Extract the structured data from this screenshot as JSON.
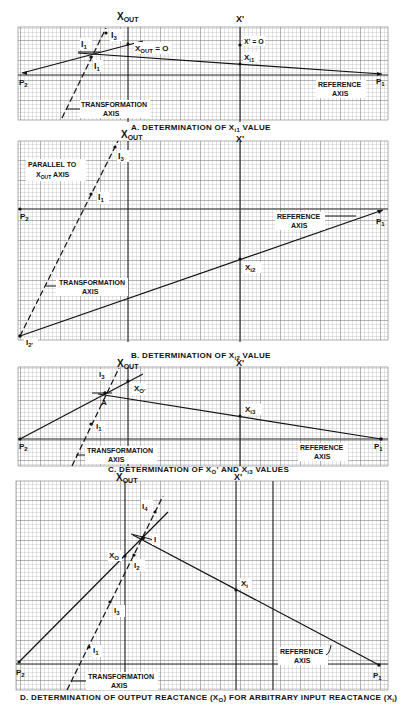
{
  "figure": {
    "colors": {
      "background": "#ffffff",
      "grid_minor": "#9a9a9a",
      "grid_major": "#3a3a3a",
      "ink": "#111111"
    },
    "panels": [
      {
        "id": "A",
        "caption": "A. DETERMINATION OF X",
        "caption_sub": "i1",
        "caption_tail": " VALUE",
        "axis_top_left": "X",
        "axis_top_left_sub": "OUT",
        "axis_top_right": "X'",
        "labels": {
          "i3": "I",
          "i3_sub": "3",
          "i1p": "I",
          "i1p_sub": "1",
          "i1": "I",
          "i1_sub": "1",
          "xout_zero": "X",
          "xout_zero_sub": "OUT",
          "xout_zero_tail": " = O",
          "xprime_zero": "X' = O",
          "xi1": "X",
          "xi1_sub": "i1",
          "p1": "P",
          "p1_sub": "1",
          "p2": "P",
          "p2_sub": "2",
          "ref_axis_1": "REFERENCE",
          "ref_axis_2": "AXIS",
          "trans_axis_1": "TRANSFORMATION",
          "trans_axis_2": "AXIS"
        }
      },
      {
        "id": "B",
        "caption": "B. DETERMINATION OF X",
        "caption_sub": "i2",
        "caption_tail": " VALUE",
        "axis_top_left": "X",
        "axis_top_left_sub": "OUT",
        "axis_top_right": "X'",
        "labels": {
          "i3": "I",
          "i3_sub": "3",
          "i1": "I",
          "i1_sub": "1",
          "i2p": "I",
          "i2p_sub": "2'",
          "parallel_1": "PARALLEL TO",
          "parallel_2": "X",
          "parallel_2_sub": "OUT",
          "parallel_2_tail": " AXIS",
          "xi2": "X",
          "xi2_sub": "i2",
          "p1": "P",
          "p1_sub": "1",
          "p2": "P",
          "p2_sub": "2",
          "ref_axis_1": "REFERENCE",
          "ref_axis_2": "AXIS",
          "trans_axis_1": "TRANSFORMATION",
          "trans_axis_2": "AXIS"
        }
      },
      {
        "id": "C",
        "caption": "C. DETERMINATION OF X",
        "caption_sub1": "O",
        "caption_mid": "' AND X",
        "caption_sub2": "i3",
        "caption_tail": " VALUES",
        "axis_top_left": "X",
        "axis_top_left_sub": "OUT",
        "axis_top_right": "X'",
        "labels": {
          "i3": "I",
          "i3_sub": "3",
          "xo_prime": "X",
          "xo_prime_sub": "O'",
          "a": "A",
          "i1": "I",
          "i1_sub": "1",
          "xi3": "X",
          "xi3_sub": "i3",
          "p1": "P",
          "p1_sub": "1",
          "p2": "P",
          "p2_sub": "2",
          "ref_axis_1": "REFERENCE",
          "ref_axis_2": "AXIS",
          "trans_axis_1": "TRANSFORMATION",
          "trans_axis_2": "AXIS"
        }
      },
      {
        "id": "D",
        "caption": "D. DETERMINATION OF OUTPUT REACTANCE (X",
        "caption_sub1": "O",
        "caption_mid": ") FOR ARBITRARY INPUT REACTANCE (X",
        "caption_sub2": "i",
        "caption_tail": ")",
        "axis_top_left": "X",
        "axis_top_left_sub": "OUT",
        "axis_top_right": "X'",
        "labels": {
          "i4": "I",
          "i4_sub": "4",
          "i": "I",
          "xo": "X",
          "xo_sub": "O",
          "i2": "I",
          "i2_sub": "2",
          "i3": "I",
          "i3_sub": "3",
          "i1": "I",
          "i1_sub": "1",
          "xi": "X",
          "xi_sub": "i",
          "p1": "P",
          "p1_sub": "1",
          "p2": "P",
          "p2_sub": "2",
          "ref_axis_1": "REFERENCE",
          "ref_axis_2": "AXIS",
          "trans_axis_1": "TRANSFORMATION",
          "trans_axis_2": "AXIS"
        }
      }
    ]
  }
}
